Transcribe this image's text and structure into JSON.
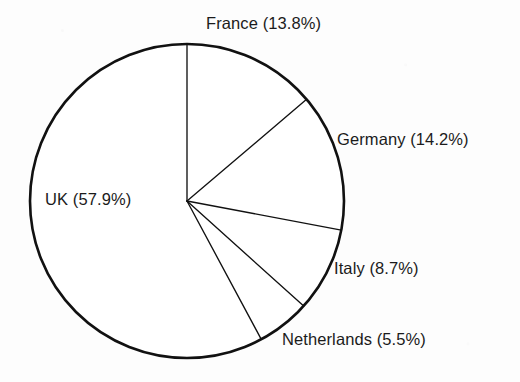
{
  "chart_data": {
    "type": "pie",
    "title": "",
    "categories": [
      "France",
      "Germany",
      "Italy",
      "Netherlands",
      "UK"
    ],
    "values": [
      13.8,
      14.2,
      8.7,
      5.5,
      57.9
    ],
    "unit": "%",
    "start_angle_deg": 0,
    "direction": "clockwise",
    "legend_position": "none",
    "labels_outside": true,
    "grid": false,
    "slice_fill": "#ffffff",
    "slice_stroke": "#111111",
    "slices": [
      {
        "name": "France",
        "value": 13.8,
        "label": "France (13.8%)"
      },
      {
        "name": "Germany",
        "value": 14.2,
        "label": "Germany (14.2%)"
      },
      {
        "name": "Italy",
        "value": 8.7,
        "label": "Italy (8.7%)"
      },
      {
        "name": "Netherlands",
        "value": 5.5,
        "label": "Netherlands (5.5%)"
      },
      {
        "name": "UK",
        "value": 57.9,
        "label": "UK (57.9%)"
      }
    ]
  },
  "labels": {
    "france": "France (13.8%)",
    "germany": "Germany (14.2%)",
    "italy": "Italy (8.7%)",
    "netherlands": "Netherlands (5.5%)",
    "uk": "UK (57.9%)"
  },
  "colors": {
    "background": "#fdfdfd",
    "ink": "#111111",
    "text": "#1b1b1b"
  }
}
